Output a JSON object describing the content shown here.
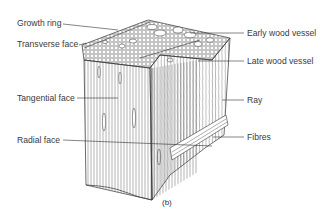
{
  "diagram": {
    "caption": "(b)",
    "labels_left": [
      {
        "id": "growth-ring",
        "text": "Growth ring"
      },
      {
        "id": "transverse-face",
        "text": "Transverse face"
      },
      {
        "id": "tangential-face",
        "text": "Tangential face"
      },
      {
        "id": "radial-face",
        "text": "Radial face"
      }
    ],
    "labels_right": [
      {
        "id": "early-wood-vessel",
        "text": "Early wood vessel"
      },
      {
        "id": "late-wood-vessel",
        "text": "Late wood vessel"
      },
      {
        "id": "ray",
        "text": "Ray"
      },
      {
        "id": "fibres",
        "text": "Fibres"
      }
    ],
    "colors": {
      "line": "#333333",
      "background": "#ffffff"
    }
  }
}
